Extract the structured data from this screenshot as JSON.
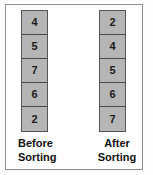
{
  "figure": {
    "background_color": "#fdfdfd",
    "frame_color": "#8d8d8d",
    "box_fill_color": "#b5b5b5",
    "box_border_color": "#555555",
    "text_color": "#1a1a1a"
  },
  "chart_data": {
    "type": "table",
    "title": "",
    "subtitle": "",
    "xlabel": "",
    "ylabel": "",
    "legend_position": "below",
    "grid": false,
    "columns": [
      {
        "label_line1": "Before",
        "label_line2": "Sorting",
        "caption": "Before Sorting",
        "values": [
          4,
          5,
          7,
          6,
          2
        ]
      },
      {
        "label_line1": "After",
        "label_line2": "Sorting",
        "caption": "After Sorting",
        "values": [
          2,
          4,
          5,
          6,
          7
        ]
      }
    ]
  },
  "columns": {
    "before": {
      "cells": [
        {
          "value": "4"
        },
        {
          "value": "5"
        },
        {
          "value": "7"
        },
        {
          "value": "6"
        },
        {
          "value": "2"
        }
      ],
      "caption_line1": "Before",
      "caption_line2": "Sorting"
    },
    "after": {
      "cells": [
        {
          "value": "2"
        },
        {
          "value": "4"
        },
        {
          "value": "5"
        },
        {
          "value": "6"
        },
        {
          "value": "7"
        }
      ],
      "caption_line1": "After",
      "caption_line2": "Sorting"
    }
  }
}
